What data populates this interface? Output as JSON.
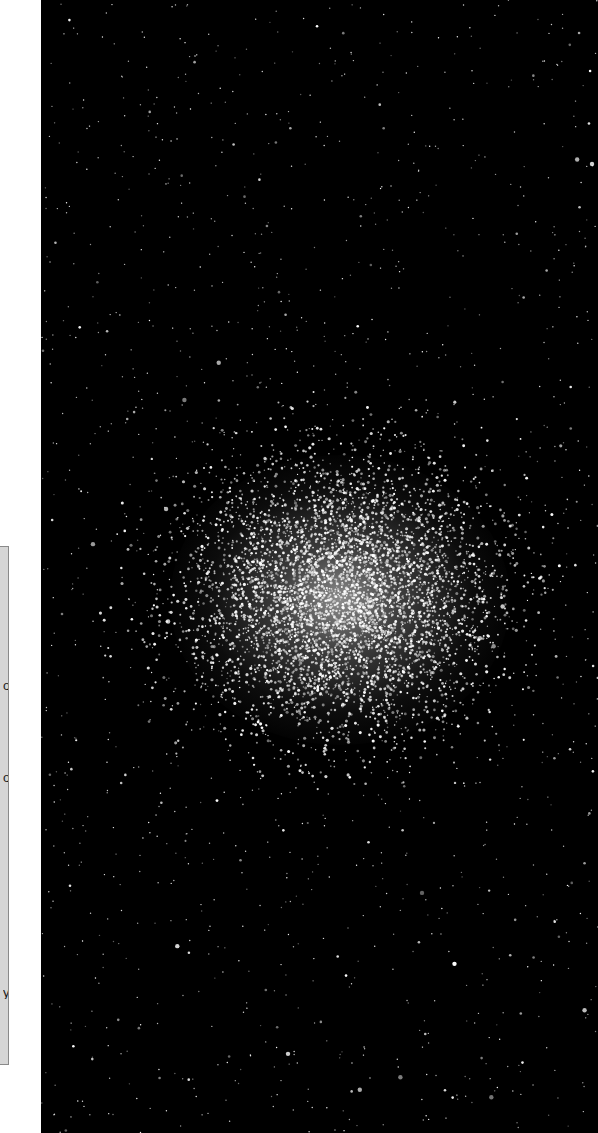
{
  "panel": {
    "glyphs": [
      {
        "char": "o",
        "top": 132
      },
      {
        "char": "o",
        "top": 224
      },
      {
        "char": "y",
        "top": 439
      }
    ],
    "background": "#d6d6d6",
    "border": "#8a8a8a"
  },
  "image": {
    "subject": "globular-star-cluster",
    "background": "#000000",
    "cluster_center": {
      "x": 299,
      "y": 595
    },
    "cluster_radius": {
      "x": 130,
      "y": 115
    },
    "field_star_count": 1400,
    "cluster_star_count": 5200
  }
}
